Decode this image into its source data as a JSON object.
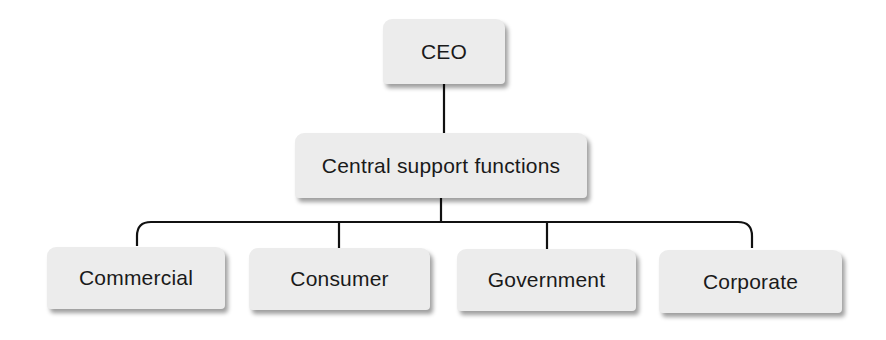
{
  "diagram": {
    "type": "org-chart",
    "root": {
      "label": "CEO",
      "children": [
        {
          "label": "Central support functions",
          "children": [
            {
              "label": "Commercial"
            },
            {
              "label": "Consumer"
            },
            {
              "label": "Government"
            },
            {
              "label": "Corporate"
            }
          ]
        }
      ]
    },
    "colors": {
      "box_fill": "#ececec",
      "line": "#111111",
      "text": "#1a1a1a",
      "background": "#ffffff"
    }
  },
  "nodes": {
    "ceo": "CEO",
    "central": "Central support functions",
    "divisions": [
      "Commercial",
      "Consumer",
      "Government",
      "Corporate"
    ]
  }
}
